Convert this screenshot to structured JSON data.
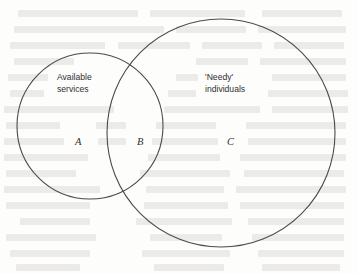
{
  "diagram": {
    "type": "venn-two-set",
    "background_note": "faint mirrored bleed-through text from reverse of scanned page",
    "stroke_color": "#4a4a4a",
    "text_color": "#2f2f2f",
    "sets": [
      {
        "id": "left",
        "label_line1": "Available",
        "label_line2": "services",
        "cx": 90,
        "cy": 126,
        "r": 73
      },
      {
        "id": "right",
        "label_line1": "'Needy'",
        "label_line2": "individuals",
        "cx": 221,
        "cy": 133,
        "r": 114
      }
    ],
    "regions": [
      {
        "id": "a",
        "letter": "A",
        "meaning": "available services only"
      },
      {
        "id": "b",
        "letter": "B",
        "meaning": "overlap of available services and needy individuals"
      },
      {
        "id": "c",
        "letter": "C",
        "meaning": "needy individuals only"
      }
    ],
    "bleed_lines": [
      {
        "x": 18,
        "y": 10,
        "w": 120
      },
      {
        "x": 150,
        "y": 10,
        "w": 95
      },
      {
        "x": 262,
        "y": 10,
        "w": 80
      },
      {
        "x": 14,
        "y": 26,
        "w": 150
      },
      {
        "x": 176,
        "y": 26,
        "w": 70
      },
      {
        "x": 258,
        "y": 26,
        "w": 88
      },
      {
        "x": 10,
        "y": 42,
        "w": 95
      },
      {
        "x": 118,
        "y": 42,
        "w": 72
      },
      {
        "x": 202,
        "y": 42,
        "w": 60
      },
      {
        "x": 274,
        "y": 42,
        "w": 70
      },
      {
        "x": 14,
        "y": 58,
        "w": 60
      },
      {
        "x": 196,
        "y": 58,
        "w": 52
      },
      {
        "x": 260,
        "y": 58,
        "w": 86
      },
      {
        "x": 8,
        "y": 74,
        "w": 40
      },
      {
        "x": 176,
        "y": 74,
        "w": 22
      },
      {
        "x": 272,
        "y": 74,
        "w": 74
      },
      {
        "x": 10,
        "y": 90,
        "w": 34
      },
      {
        "x": 168,
        "y": 90,
        "w": 28
      },
      {
        "x": 268,
        "y": 90,
        "w": 80
      },
      {
        "x": 4,
        "y": 106,
        "w": 110
      },
      {
        "x": 164,
        "y": 106,
        "w": 96
      },
      {
        "x": 272,
        "y": 106,
        "w": 76
      },
      {
        "x": 6,
        "y": 122,
        "w": 54
      },
      {
        "x": 96,
        "y": 122,
        "w": 30
      },
      {
        "x": 156,
        "y": 122,
        "w": 60
      },
      {
        "x": 246,
        "y": 122,
        "w": 100
      },
      {
        "x": 4,
        "y": 138,
        "w": 60
      },
      {
        "x": 98,
        "y": 138,
        "w": 28
      },
      {
        "x": 152,
        "y": 138,
        "w": 66
      },
      {
        "x": 248,
        "y": 138,
        "w": 98
      },
      {
        "x": 4,
        "y": 154,
        "w": 84
      },
      {
        "x": 148,
        "y": 154,
        "w": 72
      },
      {
        "x": 240,
        "y": 154,
        "w": 106
      },
      {
        "x": 6,
        "y": 170,
        "w": 70
      },
      {
        "x": 140,
        "y": 170,
        "w": 90
      },
      {
        "x": 244,
        "y": 170,
        "w": 100
      },
      {
        "x": 4,
        "y": 186,
        "w": 96
      },
      {
        "x": 146,
        "y": 186,
        "w": 78
      },
      {
        "x": 236,
        "y": 186,
        "w": 110
      },
      {
        "x": 6,
        "y": 202,
        "w": 84
      },
      {
        "x": 144,
        "y": 202,
        "w": 84
      },
      {
        "x": 240,
        "y": 202,
        "w": 104
      },
      {
        "x": 20,
        "y": 218,
        "w": 70
      },
      {
        "x": 136,
        "y": 218,
        "w": 96
      },
      {
        "x": 248,
        "y": 218,
        "w": 96
      },
      {
        "x": 6,
        "y": 234,
        "w": 90
      },
      {
        "x": 150,
        "y": 234,
        "w": 72
      },
      {
        "x": 252,
        "y": 234,
        "w": 92
      },
      {
        "x": 10,
        "y": 250,
        "w": 80
      },
      {
        "x": 142,
        "y": 250,
        "w": 88
      },
      {
        "x": 258,
        "y": 250,
        "w": 86
      },
      {
        "x": 16,
        "y": 264,
        "w": 64
      },
      {
        "x": 154,
        "y": 264,
        "w": 70
      },
      {
        "x": 262,
        "y": 264,
        "w": 78
      }
    ]
  }
}
